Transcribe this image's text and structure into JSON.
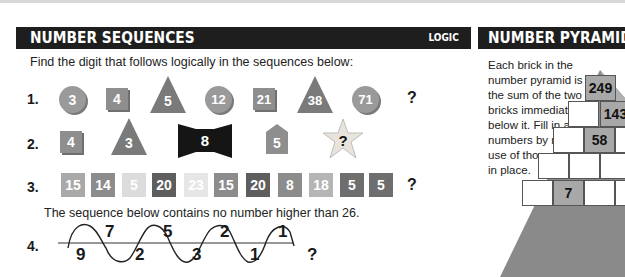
{
  "left_panel": {
    "title": "NUMBER SEQUENCES",
    "tag": "LOGIC",
    "intro": "Find the digit that follows logically in the sequences below:",
    "sequences": [
      {
        "label": "1.",
        "items": [
          {
            "shape": "circle",
            "value": "3"
          },
          {
            "shape": "square",
            "value": "4"
          },
          {
            "shape": "triangle",
            "value": "5"
          },
          {
            "shape": "circle",
            "value": "12"
          },
          {
            "shape": "square",
            "value": "21"
          },
          {
            "shape": "triangle",
            "value": "38"
          },
          {
            "shape": "circle",
            "value": "71"
          },
          {
            "shape": "answer",
            "value": "?"
          }
        ]
      },
      {
        "label": "2.",
        "items": [
          {
            "shape": "square",
            "value": "4"
          },
          {
            "shape": "triangle",
            "value": "3"
          },
          {
            "shape": "bowtie",
            "value": "8"
          },
          {
            "shape": "pentagon",
            "value": "5"
          },
          {
            "shape": "star",
            "value": "?"
          }
        ]
      },
      {
        "label": "3.",
        "items": [
          {
            "value": "15",
            "color": "#a9a9a9"
          },
          {
            "value": "14",
            "color": "#8c8c8c"
          },
          {
            "value": "5",
            "color": "#dcdcdc"
          },
          {
            "value": "20",
            "color": "#5e5e5e"
          },
          {
            "value": "23",
            "color": "#e6e6e6"
          },
          {
            "value": "15",
            "color": "#8c8c8c"
          },
          {
            "value": "20",
            "color": "#5e5e5e"
          },
          {
            "value": "8",
            "color": "#8c8c8c"
          },
          {
            "value": "18",
            "color": "#b5b5b5"
          },
          {
            "value": "5",
            "color": "#6e6e6e"
          },
          {
            "value": "5",
            "color": "#6e6e6e"
          },
          {
            "value": "?",
            "color": "none"
          }
        ]
      },
      {
        "label": "4.",
        "note": "The sequence below contains no number higher than 26.",
        "above": [
          "7",
          "5",
          "2",
          "1"
        ],
        "below": [
          "9",
          "2",
          "3",
          "1",
          "?"
        ]
      }
    ]
  },
  "right_panel": {
    "title": "NUMBER PYRAMID",
    "description": "Each brick in the number pyramid is the sum of the two bricks immediately below it. Fill in all the numbers by making use of those already in place.",
    "bricks": {
      "row1": "249",
      "row2": [
        "",
        "143"
      ],
      "row3": [
        "",
        "58",
        ""
      ],
      "row4": [
        "",
        "",
        ""
      ],
      "row5": [
        "",
        "7",
        "",
        ""
      ]
    }
  },
  "colors": {
    "header_bg": "#1e1e1e",
    "shape_gray": "#9a9a9a",
    "triangle_dark": "#7a7a7a",
    "pyramid_gray": "#8a8a8a"
  }
}
